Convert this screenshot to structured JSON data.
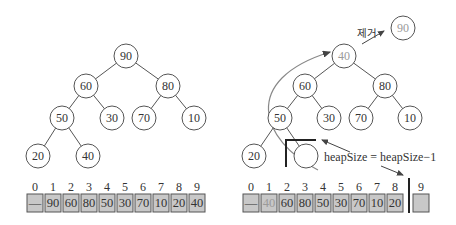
{
  "left_panel": {
    "tree": {
      "nodes": [
        {
          "id": "n1",
          "value": "90",
          "x": 126,
          "y": 56
        },
        {
          "id": "n2",
          "value": "60",
          "x": 86,
          "y": 86
        },
        {
          "id": "n3",
          "value": "80",
          "x": 168,
          "y": 86
        },
        {
          "id": "n4",
          "value": "50",
          "x": 62,
          "y": 118
        },
        {
          "id": "n5",
          "value": "30",
          "x": 112,
          "y": 118
        },
        {
          "id": "n6",
          "value": "70",
          "x": 144,
          "y": 118
        },
        {
          "id": "n7",
          "value": "10",
          "x": 194,
          "y": 118
        },
        {
          "id": "n8",
          "value": "20",
          "x": 38,
          "y": 156
        },
        {
          "id": "n9",
          "value": "40",
          "x": 88,
          "y": 156
        }
      ]
    },
    "array": {
      "indices": [
        "0",
        "1",
        "2",
        "3",
        "4",
        "5",
        "6",
        "7",
        "8",
        "9"
      ],
      "values": [
        "—",
        "90",
        "60",
        "80",
        "50",
        "30",
        "70",
        "10",
        "20",
        "40"
      ]
    }
  },
  "right_panel": {
    "removed_label": "제거",
    "removed_node": "90",
    "tree": {
      "nodes": [
        {
          "id": "n1",
          "value": "40",
          "x": 344,
          "y": 56,
          "faded": true
        },
        {
          "id": "n2",
          "value": "60",
          "x": 305,
          "y": 86
        },
        {
          "id": "n3",
          "value": "80",
          "x": 385,
          "y": 86
        },
        {
          "id": "n4",
          "value": "50",
          "x": 280,
          "y": 118
        },
        {
          "id": "n5",
          "value": "30",
          "x": 329,
          "y": 118
        },
        {
          "id": "n6",
          "value": "70",
          "x": 361,
          "y": 118
        },
        {
          "id": "n7",
          "value": "10",
          "x": 410,
          "y": 118
        },
        {
          "id": "n8",
          "value": "20",
          "x": 254,
          "y": 156
        },
        {
          "id": "n9",
          "value": "",
          "x": 306,
          "y": 156
        }
      ]
    },
    "annotation": "heapSize = heapSize−1",
    "array": {
      "indices": [
        "0",
        "1",
        "2",
        "3",
        "4",
        "5",
        "6",
        "7",
        "8",
        "9"
      ],
      "values": [
        "—",
        "40",
        "60",
        "80",
        "50",
        "30",
        "70",
        "10",
        "20",
        ""
      ]
    }
  }
}
